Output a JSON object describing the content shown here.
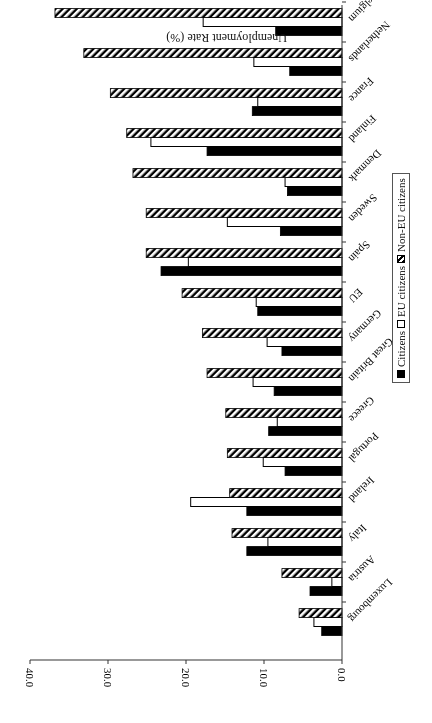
{
  "chart_data": {
    "type": "bar",
    "orientation": "horizontal",
    "rendered_rotation_deg": 180,
    "title": "",
    "xlabel": "Unemployment Rate (%)",
    "ylabel": "",
    "xlim": [
      0,
      40
    ],
    "x_ticks": [
      "0.0",
      "10.0",
      "20.0",
      "30.0",
      "40.0"
    ],
    "grid": false,
    "legend_position": "right (rotated), horizontal box",
    "categories": [
      "Luxembourg",
      "Austria",
      "Italy",
      "Ireland",
      "Portugal",
      "Greece",
      "Great Britain",
      "Germany",
      "EU",
      "Spain",
      "Sweden",
      "Denmark",
      "Finland",
      "France",
      "Netherlands",
      "Belgium"
    ],
    "series": [
      {
        "name": "Citizens",
        "style": "solid black",
        "values": [
          2.6,
          4.1,
          12.2,
          12.2,
          7.3,
          9.4,
          8.7,
          7.7,
          10.8,
          23.2,
          7.9,
          7.0,
          17.3,
          11.5,
          6.7,
          8.5
        ]
      },
      {
        "name": "EU citizens",
        "style": "white",
        "values": [
          3.6,
          1.3,
          9.5,
          19.4,
          10.1,
          8.3,
          11.4,
          9.6,
          11.0,
          19.7,
          14.7,
          7.3,
          24.5,
          10.8,
          11.3,
          17.8
        ]
      },
      {
        "name": "Non-EU citizens",
        "style": "diagonal hatch",
        "values": [
          5.5,
          7.7,
          14.1,
          14.4,
          14.7,
          14.9,
          17.3,
          17.9,
          20.5,
          25.1,
          25.1,
          26.8,
          27.6,
          29.7,
          33.1,
          36.8
        ]
      }
    ]
  },
  "legend": {
    "citizens": "Citizens",
    "eu": "EU citizens",
    "noneu": "Non-EU citizens"
  }
}
